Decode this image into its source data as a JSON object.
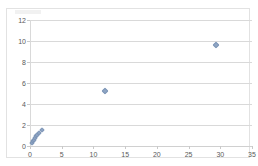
{
  "chart_data": {
    "type": "scatter",
    "title": "",
    "subtitle": "",
    "xlabel": "",
    "ylabel": "",
    "xlim": [
      0,
      35
    ],
    "ylim": [
      0,
      12
    ],
    "xticks": [
      0,
      5,
      10,
      15,
      20,
      25,
      30,
      35
    ],
    "yticks": [
      0,
      2,
      4,
      6,
      8,
      10,
      12
    ],
    "xtick_labels": [
      "0",
      "5",
      "10",
      "15",
      "20",
      "25",
      "30",
      "35"
    ],
    "ytick_labels": [
      "0",
      "2",
      "4",
      "6",
      "8",
      "10",
      "12"
    ],
    "grid": "horizontal",
    "legend": "none",
    "marker": "diamond",
    "marker_color": "#8ea5c4",
    "marker_edge_color": "#7d95b6",
    "series": [
      {
        "name": "Series 1",
        "points": [
          {
            "x": 0.25,
            "y": 0.25
          },
          {
            "x": 0.45,
            "y": 0.45
          },
          {
            "x": 0.6,
            "y": 0.6
          },
          {
            "x": 0.8,
            "y": 0.8
          },
          {
            "x": 0.95,
            "y": 0.95
          },
          {
            "x": 1.15,
            "y": 1.05
          },
          {
            "x": 1.35,
            "y": 1.2
          },
          {
            "x": 1.9,
            "y": 1.55
          },
          {
            "x": 11.8,
            "y": 5.25
          },
          {
            "x": 29.4,
            "y": 9.6
          }
        ]
      }
    ]
  }
}
